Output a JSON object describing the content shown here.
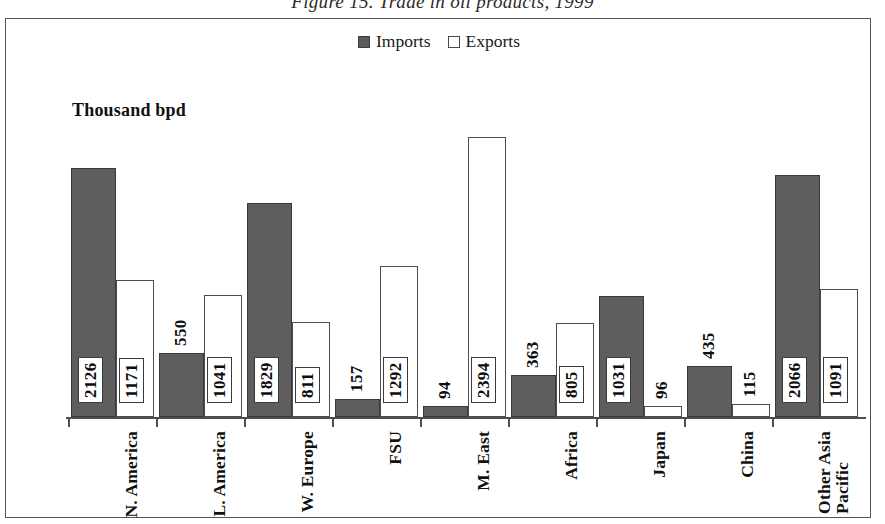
{
  "figure": {
    "caption": "Figure 15.  Trade in oil products, 1999"
  },
  "legend": {
    "position": "top-center",
    "entries": [
      {
        "label": "Imports",
        "swatch": "filled-dark-square",
        "color": "#5e5e5e"
      },
      {
        "label": "Exports",
        "swatch": "open-white-square",
        "color": "#ffffff"
      }
    ]
  },
  "axis_unit_title": "Thousand bpd",
  "chart_data": {
    "type": "bar",
    "title": "Figure 15.  Trade in oil products, 1999",
    "xlabel": "",
    "ylabel": "Thousand bpd",
    "ylim": [
      0,
      2500
    ],
    "grid": false,
    "legend_position": "top-center",
    "categories": [
      "N. America",
      "L. America",
      "W. Europe",
      "FSU",
      "M. East",
      "Africa",
      "Japan",
      "China",
      "Other Asia Pacific"
    ],
    "series": [
      {
        "name": "Imports",
        "color": "#5e5e5e",
        "values": [
          2126,
          550,
          1829,
          157,
          94,
          363,
          1031,
          435,
          2066
        ]
      },
      {
        "name": "Exports",
        "color": "#ffffff",
        "values": [
          1171,
          1041,
          811,
          1292,
          2394,
          805,
          96,
          115,
          1091
        ]
      }
    ],
    "data_labels": {
      "Imports": [
        "2126",
        "550",
        "1829",
        "157",
        "94",
        "363",
        "1031",
        "435",
        "2066"
      ],
      "Exports": [
        "1171",
        "1041",
        "811",
        "1292",
        "2394",
        "805",
        "96",
        "115",
        "1091"
      ]
    }
  },
  "category_labels": [
    {
      "text": "N. America",
      "line2": ""
    },
    {
      "text": "L. America",
      "line2": ""
    },
    {
      "text": "W. Europe",
      "line2": ""
    },
    {
      "text": "FSU",
      "line2": ""
    },
    {
      "text": "M. East",
      "line2": ""
    },
    {
      "text": "Africa",
      "line2": ""
    },
    {
      "text": "Japan",
      "line2": ""
    },
    {
      "text": "China",
      "line2": ""
    },
    {
      "text": "Other Asia",
      "line2": "Pacific"
    }
  ],
  "colors": {
    "imports_fill": "#5e5e5e",
    "exports_fill": "#ffffff",
    "axis": "#4f4f4f",
    "frame": "#545454",
    "text": "#111111"
  }
}
